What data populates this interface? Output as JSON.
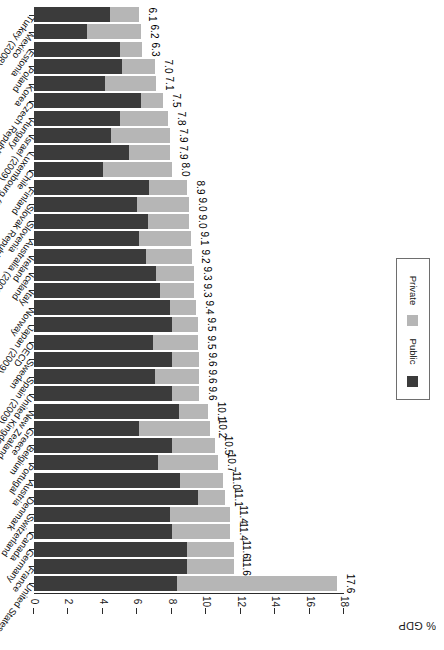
{
  "chart_data": {
    "type": "bar",
    "orientation": "horizontal-stacked",
    "title": "",
    "xlabel": "% GDP",
    "ylabel": "",
    "xlim": [
      0,
      18
    ],
    "xticks": [
      0,
      2,
      4,
      6,
      8,
      10,
      12,
      14,
      16,
      18
    ],
    "grid": false,
    "legend_position": "right",
    "legend": [
      "Public",
      "Private"
    ],
    "colors": {
      "public": "#3b3b3b",
      "private": "#b6b6b6"
    },
    "categories": [
      "United States",
      "France",
      "Germany",
      "Canada",
      "Switzerland",
      "Denmark",
      "Austria",
      "Portugal",
      "Belgium",
      "Greece",
      "New Zealand",
      "United Kingdom",
      "Spain (2009)",
      "Sweden",
      "OECD",
      "Japan (2009)",
      "Norway",
      "Italy",
      "Iceland",
      "Ireland",
      "Australia (2009)",
      "Slovenia",
      "Slovak Republic",
      "Finland",
      "Chile",
      "Luxembourg (2009)",
      "Israel (2009)",
      "Hungary",
      "Czech Republic",
      "Korea",
      "Poland",
      "Estonia",
      "Mexico",
      "Turkey (2008)"
    ],
    "values": [
      17.6,
      11.6,
      11.6,
      11.4,
      11.4,
      11.1,
      11.0,
      10.7,
      10.5,
      10.2,
      10.1,
      9.6,
      9.6,
      9.6,
      9.5,
      9.5,
      9.4,
      9.3,
      9.3,
      9.2,
      9.1,
      9.0,
      9.0,
      8.9,
      8.0,
      7.9,
      7.9,
      7.8,
      7.5,
      7.1,
      7.0,
      6.3,
      6.2,
      6.1
    ],
    "series": [
      {
        "name": "Public",
        "values": [
          8.3,
          8.9,
          8.9,
          8.0,
          7.9,
          9.5,
          8.5,
          7.2,
          8.0,
          6.1,
          8.4,
          8.0,
          7.0,
          8.0,
          6.9,
          8.0,
          7.9,
          7.3,
          7.1,
          6.5,
          6.1,
          6.6,
          6.0,
          6.7,
          4.0,
          5.5,
          4.5,
          5.0,
          6.2,
          4.1,
          5.1,
          5.0,
          3.1,
          4.4
        ]
      },
      {
        "name": "Private",
        "values": [
          9.3,
          2.7,
          2.7,
          3.4,
          3.5,
          1.6,
          2.5,
          3.5,
          2.5,
          4.1,
          1.7,
          1.6,
          2.6,
          1.6,
          2.6,
          1.5,
          1.5,
          2.0,
          2.2,
          2.7,
          3.0,
          2.4,
          3.0,
          2.2,
          4.0,
          2.4,
          3.4,
          2.8,
          1.3,
          3.0,
          1.9,
          1.3,
          3.1,
          1.7
        ]
      }
    ],
    "value_labels": [
      "17.6",
      "11.6",
      "11.6",
      "11.4",
      "11.4",
      "11.1",
      "11.0",
      "10.7",
      "10.5",
      "10.2",
      "10.1",
      "9.6",
      "9.6",
      "9.6",
      "9.5",
      "9.5",
      "9.4",
      "9.3",
      "9.3",
      "9.2",
      "9.1",
      "9.0",
      "9.0",
      "8.9",
      "8.0",
      "7.9",
      "7.9",
      "7.8",
      "7.5",
      "7.1",
      "7.0",
      "6.3",
      "6.2",
      "6.1"
    ]
  },
  "axis": {
    "title": "% GDP",
    "tick_labels": [
      "0",
      "2",
      "4",
      "6",
      "8",
      "10",
      "12",
      "14",
      "16",
      "18"
    ]
  },
  "legend": {
    "items": [
      {
        "label": "Public",
        "color": "#3b3b3b"
      },
      {
        "label": "Private",
        "color": "#b6b6b6"
      }
    ]
  }
}
